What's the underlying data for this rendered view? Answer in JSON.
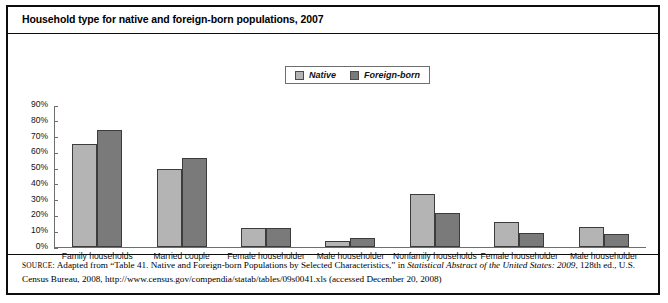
{
  "figure": {
    "title": "Household type for native and foreign-born populations, 2007"
  },
  "legend": {
    "entries": [
      {
        "label": "Native",
        "color": "#b4b4b4"
      },
      {
        "label": "Foreign-born",
        "color": "#7a7a7a"
      }
    ]
  },
  "source": {
    "prefix": "SOURCE",
    "part1": ": Adapted from “Table 41. Native and Foreign-born Populations by Selected Characteristics,” in ",
    "italic1": "Statistical Abstract of the United States: 2009",
    "part2": ", 128th ed., U.S. Census Bureau, 2008, http://www.census.gov/compendia/statab/tables/09s0041.xls (accessed December 20, 2008)"
  },
  "chart_data": {
    "type": "bar",
    "title": "Household type for native and foreign-born populations, 2007",
    "xlabel": "",
    "ylabel": "",
    "ylim": [
      0,
      90
    ],
    "grid": false,
    "legend_position": "top-center",
    "categories": [
      "Family households",
      "Married couple",
      "Female householder",
      "Male householder",
      "Nonfamily households",
      "Female householder",
      "Male householder"
    ],
    "ytick_labels": [
      "0%",
      "10%",
      "20%",
      "30%",
      "40%",
      "50%",
      "60%",
      "70%",
      "80%",
      "90%"
    ],
    "ytick_values": [
      0,
      10,
      20,
      30,
      40,
      50,
      60,
      70,
      80,
      90
    ],
    "series": [
      {
        "name": "Native",
        "color": "#b4b4b4",
        "values": [
          66,
          50,
          12,
          4,
          34,
          16,
          13
        ]
      },
      {
        "name": "Foreign-born",
        "color": "#7a7a7a",
        "values": [
          75,
          57,
          12,
          6,
          22,
          9,
          8
        ]
      }
    ]
  }
}
